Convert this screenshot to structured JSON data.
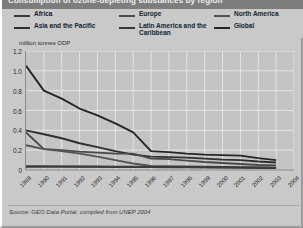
{
  "title": "Consumption of ozone-depleting substances by region",
  "unit_label": "million tonnes ODP",
  "source": "Source: GEO Data Portal, compiled from UNEP 2004",
  "legend": {
    "columns": [
      {
        "items": [
          {
            "label": "Africa",
            "color": "#3c3c3c"
          },
          {
            "label": "Asia and the Pacific",
            "color": "#2f2f2f"
          }
        ]
      },
      {
        "items": [
          {
            "label": "Europe",
            "color": "#4a4a4a"
          },
          {
            "label": "Latin America and the Caribbean",
            "color": "#383838"
          }
        ]
      },
      {
        "items": [
          {
            "label": "North America",
            "color": "#545454"
          },
          {
            "label": "Global",
            "color": "#252525"
          }
        ]
      }
    ]
  },
  "chart_data": {
    "type": "line",
    "title": "Consumption of ozone-depleting substances by region",
    "xlabel": "",
    "ylabel": "million tonnes ODP",
    "ylim": [
      0,
      1.2
    ],
    "yticks": [
      0,
      0.2,
      0.4,
      0.6,
      0.8,
      1.0,
      1.2
    ],
    "ytick_labels": [
      "0",
      "0.2",
      "0.4",
      "0.6",
      "0.8",
      "1.0",
      "1.2"
    ],
    "grid": true,
    "legend_position": "top",
    "x": [
      1989,
      1990,
      1991,
      1992,
      1993,
      1994,
      1995,
      1996,
      1997,
      1998,
      1999,
      2000,
      2001,
      2002,
      2003,
      2004
    ],
    "xtick_labels": [
      "1989",
      "1990",
      "1991",
      "1992",
      "1993",
      "1994",
      "1995",
      "1996",
      "1997",
      "1998",
      "1999",
      "2000",
      "2001",
      "2002",
      "2003",
      "2004"
    ],
    "series": [
      {
        "name": "Global",
        "color": "#252525",
        "values": [
          1.05,
          0.8,
          0.72,
          0.62,
          0.55,
          0.47,
          0.38,
          0.19,
          0.18,
          0.165,
          0.155,
          0.15,
          0.145,
          0.12,
          0.1,
          null
        ]
      },
      {
        "name": "Asia and the Pacific",
        "color": "#2f2f2f",
        "values": [
          0.4,
          0.36,
          0.32,
          0.27,
          0.23,
          0.19,
          0.155,
          0.135,
          0.13,
          0.125,
          0.115,
          0.105,
          0.1,
          0.085,
          0.075,
          null
        ]
      },
      {
        "name": "Europe",
        "color": "#4a4a4a",
        "values": [
          0.38,
          0.21,
          0.2,
          0.185,
          0.175,
          0.165,
          0.165,
          0.115,
          0.11,
          0.095,
          0.08,
          0.07,
          0.06,
          0.05,
          0.045,
          null
        ]
      },
      {
        "name": "North America",
        "color": "#545454",
        "values": [
          0.25,
          0.21,
          0.19,
          0.165,
          0.135,
          0.1,
          0.065,
          0.04,
          0.038,
          0.035,
          0.033,
          0.03,
          0.028,
          0.025,
          0.022,
          null
        ]
      },
      {
        "name": "Latin America and the Caribbean",
        "color": "#383838",
        "values": [
          0.035,
          0.035,
          0.035,
          0.035,
          0.035,
          0.034,
          0.033,
          0.032,
          0.03,
          0.029,
          0.028,
          0.027,
          0.025,
          0.023,
          0.02,
          null
        ]
      },
      {
        "name": "Africa",
        "color": "#3c3c3c",
        "values": [
          0.035,
          0.035,
          0.034,
          0.033,
          0.032,
          0.031,
          0.03,
          0.029,
          0.028,
          0.027,
          0.026,
          0.025,
          0.024,
          0.022,
          0.02,
          null
        ]
      }
    ]
  }
}
